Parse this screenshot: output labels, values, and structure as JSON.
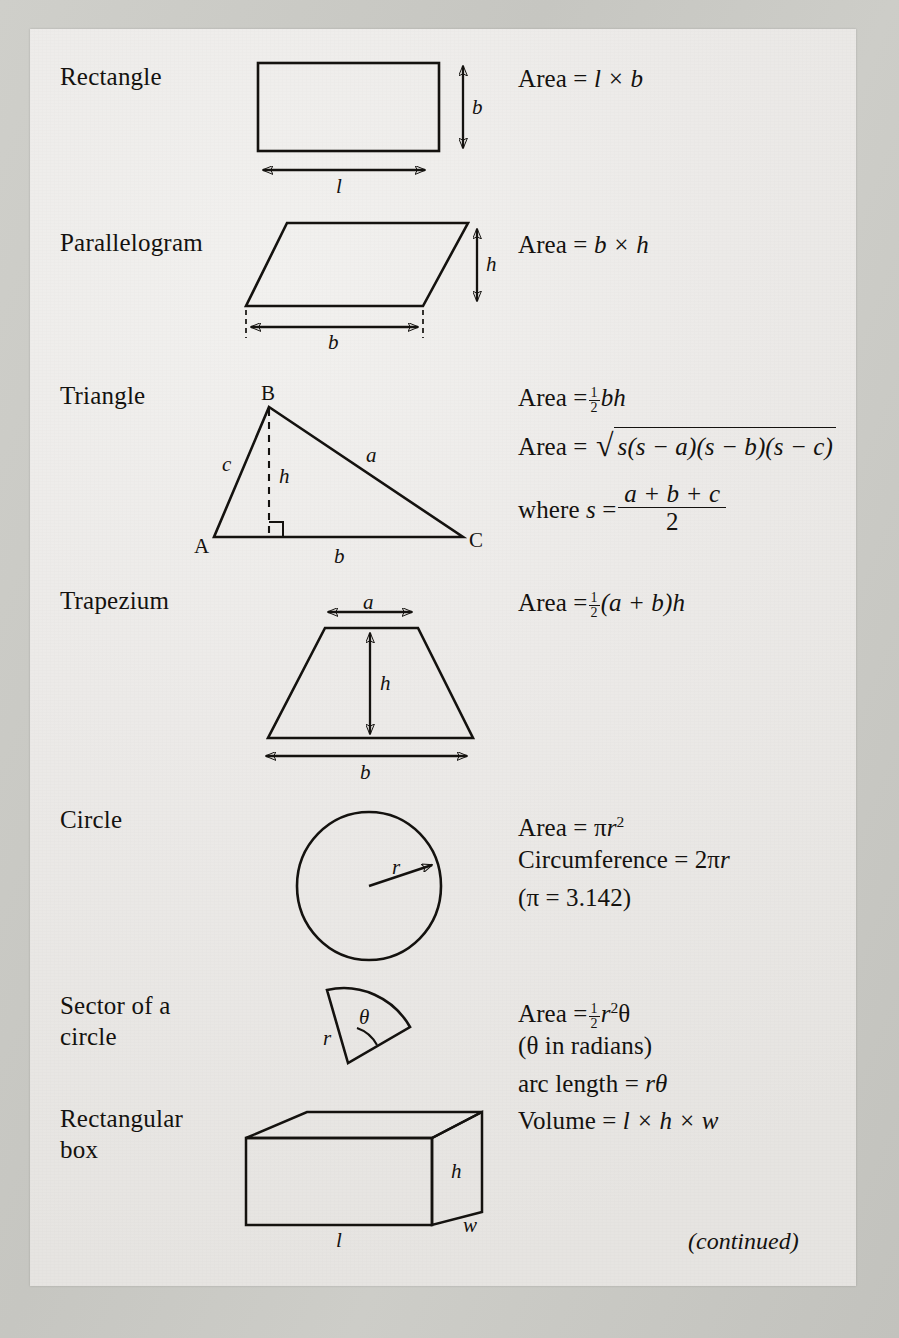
{
  "document": {
    "type": "reference-table",
    "title": "Mensuration formulae",
    "footer_note": "(continued)",
    "page_color": "#ecebe8",
    "ink_color": "#14120f",
    "scan_background": "#c8c8c3"
  },
  "rows": [
    {
      "id": "rectangle",
      "name": "Rectangle",
      "figure": "rectangle-figure",
      "figure_labels": [
        "l",
        "b"
      ],
      "formulas": [
        {
          "lead": "Area",
          "rel": "=",
          "expr": "l × b"
        }
      ]
    },
    {
      "id": "parallelogram",
      "name": "Parallelogram",
      "figure": "parallelogram-figure",
      "figure_labels": [
        "b",
        "h"
      ],
      "formulas": [
        {
          "lead": "Area",
          "rel": "=",
          "expr": "b × h"
        }
      ]
    },
    {
      "id": "triangle",
      "name": "Triangle",
      "figure": "triangle-figure",
      "figure_labels": [
        "A",
        "B",
        "C",
        "a",
        "b",
        "c",
        "h"
      ],
      "formulas": [
        {
          "lead": "Area",
          "rel": "=",
          "expr": "½ bh"
        },
        {
          "lead": "Area",
          "rel": "=",
          "expr": "√(s(s − a)(s − b)(s − c))"
        },
        {
          "lead": "where s",
          "rel": "=",
          "expr": "(a + b + c) / 2"
        }
      ]
    },
    {
      "id": "trapezium",
      "name": "Trapezium",
      "figure": "trapezium-figure",
      "figure_labels": [
        "a",
        "b",
        "h"
      ],
      "formulas": [
        {
          "lead": "Area",
          "rel": "=",
          "expr": "½(a + b)h"
        }
      ]
    },
    {
      "id": "circle",
      "name": "Circle",
      "figure": "circle-figure",
      "figure_labels": [
        "r"
      ],
      "formulas": [
        {
          "lead": "Area",
          "rel": "=",
          "expr": "πr²"
        },
        {
          "lead": "Circumference",
          "rel": "=",
          "expr": "2πr"
        },
        {
          "lead": "",
          "rel": "",
          "expr": "(π = 3.142)"
        }
      ]
    },
    {
      "id": "sector",
      "name": "Sector of a circle",
      "name_line1": "Sector of a",
      "name_line2": "circle",
      "figure": "sector-figure",
      "figure_labels": [
        "r",
        "θ"
      ],
      "formulas": [
        {
          "lead": "Area",
          "rel": "=",
          "expr": "½ r²θ"
        },
        {
          "lead": "",
          "rel": "",
          "expr": "(θ in radians)"
        },
        {
          "lead": "arc length",
          "rel": "=",
          "expr": "rθ"
        }
      ]
    },
    {
      "id": "rectangular-box",
      "name": "Rectangular box",
      "name_line1": "Rectangular",
      "name_line2": "box",
      "figure": "box-figure",
      "figure_labels": [
        "l",
        "w",
        "h"
      ],
      "formulas": [
        {
          "lead": "Volume",
          "rel": "=",
          "expr": "l × h × w"
        }
      ]
    }
  ],
  "text": {
    "rectangle_name": "Rectangle",
    "rectangle_area": "Area",
    "rectangle_eq": "=",
    "parallelogram_name": "Parallelogram",
    "parallelogram_area": "Area",
    "triangle_name": "Triangle",
    "triangle_area_1": "Area",
    "triangle_area_2": "Area",
    "triangle_where": "where",
    "triangle_s": "s",
    "triangle_num": "a + b + c",
    "triangle_den": "2",
    "trapezium_name": "Trapezium",
    "trapezium_area": "Area",
    "circle_name": "Circle",
    "circle_area": "Area",
    "circle_circumference": "Circumference",
    "circle_pi_value": "(π = 3.142)",
    "sector_name_line1": "Sector of a",
    "sector_name_line2": "circle",
    "sector_area": "Area",
    "sector_radians": "(θ in radians)",
    "sector_arc_length": "arc length",
    "box_name_line1": "Rectangular",
    "box_name_line2": "box",
    "box_volume": "Volume",
    "continued": "(continued)",
    "labels": {
      "l": "l",
      "b": "b",
      "h": "h",
      "a": "a",
      "c": "c",
      "r": "r",
      "w": "w",
      "theta": "θ",
      "A": "A",
      "B": "B",
      "C": "C"
    },
    "ops": {
      "times": "×",
      "eq": "=",
      "plus": "+",
      "minus": "−",
      "pi": "π",
      "radical": "√",
      "one": "1",
      "two": "2",
      "sq": "2"
    },
    "terms": {
      "bh": "bh",
      "s_open": "s(s",
      "minus_a": "− a)(s",
      "minus_b": "− b)(s",
      "minus_c": "− c)",
      "l_times_b": "l × b",
      "b_times_h": "b × h",
      "ab_h": "(a + b)h",
      "pi_r": "r",
      "two_pi_r": "2πr",
      "r2theta": "r",
      "r_theta": "rθ",
      "l_h_w": "l × h × w"
    }
  }
}
